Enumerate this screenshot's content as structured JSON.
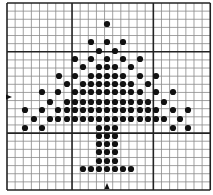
{
  "diagram": {
    "type": "stitch-chart",
    "grid": {
      "origin_x": 7,
      "origin_y": 3,
      "columns": 25,
      "rows": 23,
      "cell_size": 8.13,
      "thick_columns": [
        0,
        8,
        18,
        25
      ],
      "thick_rows": [
        0,
        6,
        16,
        23
      ],
      "line_color": "#8a8a8a",
      "thick_line_color": "#222222",
      "background": "#ffffff"
    },
    "markers": {
      "left_arrow": {
        "x": 7,
        "y": 97,
        "direction": "right"
      },
      "bottom_arrow": {
        "x": 107,
        "y": 190,
        "direction": "up"
      }
    },
    "dot_color": "#111111",
    "dot_radius": 3.1,
    "dots": [
      [
        107,
        24
      ],
      [
        91,
        42
      ],
      [
        107,
        42
      ],
      [
        123,
        42
      ],
      [
        99,
        51
      ],
      [
        115,
        51
      ],
      [
        75,
        59
      ],
      [
        91,
        59
      ],
      [
        107,
        59
      ],
      [
        123,
        59
      ],
      [
        140,
        59
      ],
      [
        83,
        67
      ],
      [
        99,
        67
      ],
      [
        107,
        67
      ],
      [
        115,
        67
      ],
      [
        131,
        67
      ],
      [
        59,
        76
      ],
      [
        75,
        76
      ],
      [
        91,
        76
      ],
      [
        99,
        76
      ],
      [
        107,
        76
      ],
      [
        115,
        76
      ],
      [
        123,
        76
      ],
      [
        140,
        76
      ],
      [
        156,
        76
      ],
      [
        67,
        84
      ],
      [
        83,
        84
      ],
      [
        91,
        84
      ],
      [
        99,
        84
      ],
      [
        107,
        84
      ],
      [
        115,
        84
      ],
      [
        123,
        84
      ],
      [
        131,
        84
      ],
      [
        148,
        84
      ],
      [
        42,
        92
      ],
      [
        58,
        92
      ],
      [
        75,
        92
      ],
      [
        83,
        92
      ],
      [
        91,
        92
      ],
      [
        99,
        92
      ],
      [
        107,
        92
      ],
      [
        115,
        92
      ],
      [
        123,
        92
      ],
      [
        131,
        92
      ],
      [
        140,
        92
      ],
      [
        156,
        92
      ],
      [
        173,
        92
      ],
      [
        50,
        102
      ],
      [
        67,
        102
      ],
      [
        75,
        102
      ],
      [
        83,
        102
      ],
      [
        91,
        102
      ],
      [
        99,
        102
      ],
      [
        107,
        102
      ],
      [
        115,
        102
      ],
      [
        123,
        102
      ],
      [
        131,
        102
      ],
      [
        140,
        102
      ],
      [
        148,
        102
      ],
      [
        164,
        102
      ],
      [
        25,
        110
      ],
      [
        42,
        110
      ],
      [
        58,
        110
      ],
      [
        67,
        110
      ],
      [
        75,
        110
      ],
      [
        83,
        110
      ],
      [
        91,
        110
      ],
      [
        99,
        110
      ],
      [
        107,
        110
      ],
      [
        115,
        110
      ],
      [
        123,
        110
      ],
      [
        131,
        110
      ],
      [
        140,
        110
      ],
      [
        148,
        110
      ],
      [
        156,
        110
      ],
      [
        173,
        110
      ],
      [
        188,
        110
      ],
      [
        34,
        119
      ],
      [
        50,
        119
      ],
      [
        58,
        119
      ],
      [
        67,
        119
      ],
      [
        75,
        119
      ],
      [
        83,
        119
      ],
      [
        91,
        119
      ],
      [
        99,
        119
      ],
      [
        107,
        119
      ],
      [
        115,
        119
      ],
      [
        123,
        119
      ],
      [
        131,
        119
      ],
      [
        140,
        119
      ],
      [
        148,
        119
      ],
      [
        156,
        119
      ],
      [
        164,
        119
      ],
      [
        180,
        119
      ],
      [
        25,
        128
      ],
      [
        42,
        128
      ],
      [
        99,
        128
      ],
      [
        107,
        128
      ],
      [
        115,
        128
      ],
      [
        173,
        128
      ],
      [
        188,
        128
      ],
      [
        99,
        136
      ],
      [
        107,
        136
      ],
      [
        115,
        136
      ],
      [
        99,
        144
      ],
      [
        107,
        144
      ],
      [
        115,
        144
      ],
      [
        99,
        152
      ],
      [
        107,
        152
      ],
      [
        115,
        152
      ],
      [
        99,
        161
      ],
      [
        107,
        161
      ],
      [
        115,
        161
      ],
      [
        83,
        169
      ],
      [
        91,
        169
      ],
      [
        99,
        169
      ],
      [
        107,
        169
      ],
      [
        115,
        169
      ],
      [
        123,
        169
      ],
      [
        131,
        169
      ]
    ]
  }
}
